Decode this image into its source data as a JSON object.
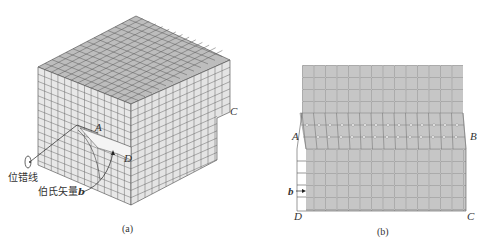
{
  "figure": {
    "panel_a": {
      "caption": "(a)",
      "labels": {
        "A": "A",
        "C": "C",
        "D": "D"
      },
      "annotations": {
        "dislocation_line": "位错线",
        "burgers_vector": "伯氏矢量",
        "burgers_symbol": "b"
      },
      "colors": {
        "top_face": "#bdbdbd",
        "side_face": "#e6e6e6",
        "grid_line": "#555555"
      }
    },
    "panel_b": {
      "caption": "(b)",
      "labels": {
        "A": "A",
        "B": "B",
        "C": "C",
        "D": "D",
        "b": "b"
      },
      "colors": {
        "fill": "#c8c8c8",
        "grid_line": "#777777",
        "node": "#ffffff"
      }
    }
  }
}
